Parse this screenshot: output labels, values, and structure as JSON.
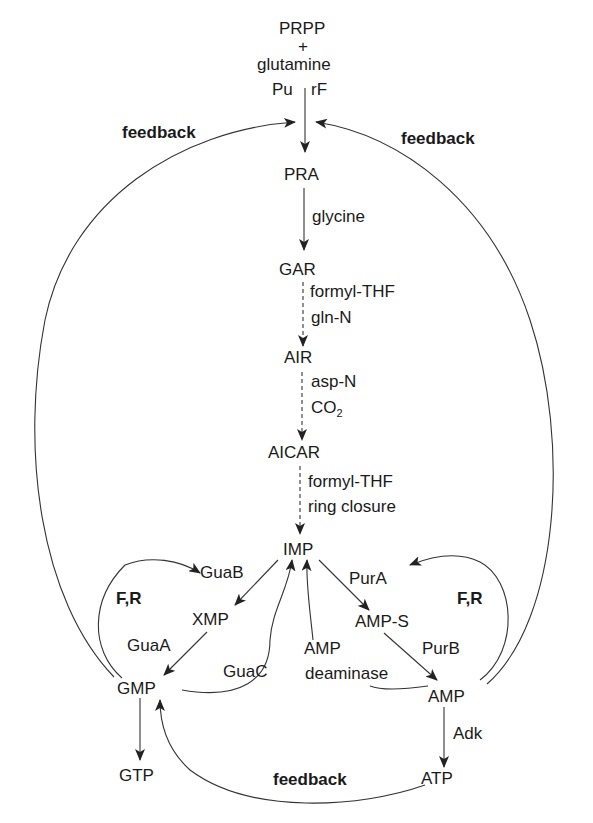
{
  "diagram": {
    "nodes": {
      "prpp": "PRPP",
      "plus": "+",
      "glutamine": "glutamine",
      "pu": "Pu",
      "rf": "rF",
      "pra": "PRA",
      "gar": "GAR",
      "air": "AIR",
      "aicar": "AICAR",
      "imp": "IMP",
      "xmp": "XMP",
      "gmp": "GMP",
      "gtp": "GTP",
      "amp_s": "AMP-S",
      "amp": "AMP",
      "atp": "ATP"
    },
    "step_labels": {
      "glycine": "glycine",
      "formyl_thf_1": "formyl-THF",
      "gln_n": "gln-N",
      "asp_n": "asp-N",
      "co2_base": "CO",
      "co2_sub": "2",
      "formyl_thf_2": "formyl-THF",
      "ring_closure": "ring closure"
    },
    "enzymes": {
      "guaB": "GuaB",
      "guaA": "GuaA",
      "guaC": "GuaC",
      "purA": "PurA",
      "purB": "PurB",
      "amp_deaminase_1": "AMP",
      "amp_deaminase_2": "deaminase",
      "adk": "Adk"
    },
    "regulation": {
      "feedback_left": "feedback",
      "feedback_right": "feedback",
      "feedback_bottom": "feedback",
      "fr_left": "F,R",
      "fr_right": "F,R"
    },
    "colors": {
      "line": "#333333",
      "text": "#1a1a1a",
      "background": "#ffffff"
    }
  }
}
